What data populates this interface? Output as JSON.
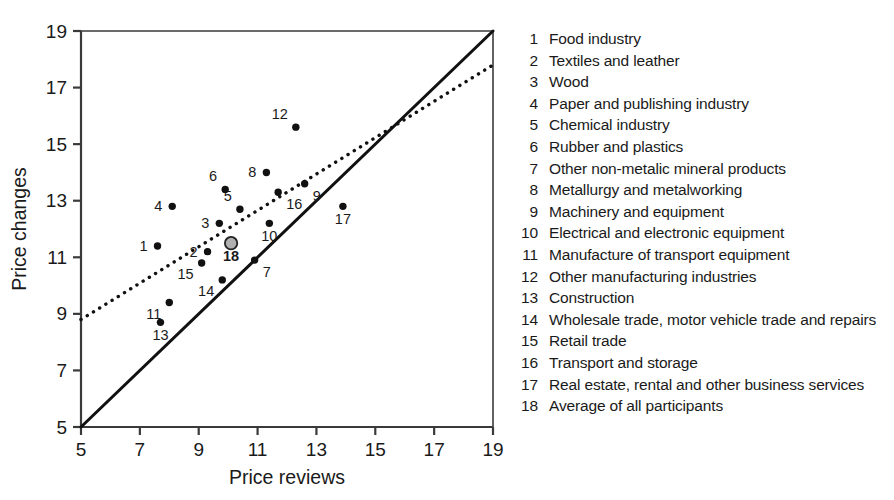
{
  "chart_data": {
    "type": "scatter",
    "title": "",
    "xlabel": "Price reviews",
    "ylabel": "Price changes",
    "xlim": [
      5,
      19
    ],
    "ylim": [
      5,
      19
    ],
    "xticks": [
      5,
      7,
      9,
      11,
      13,
      15,
      17,
      19
    ],
    "yticks": [
      5,
      7,
      9,
      11,
      13,
      15,
      17,
      19
    ],
    "grid": false,
    "legend_position": "right",
    "points": [
      {
        "id": 1,
        "x": 7.6,
        "y": 11.4,
        "label": "1",
        "label_pos": "left",
        "highlight": false
      },
      {
        "id": 2,
        "x": 9.3,
        "y": 11.2,
        "label": "2",
        "label_pos": "left",
        "highlight": false
      },
      {
        "id": 3,
        "x": 9.7,
        "y": 12.2,
        "label": "3",
        "label_pos": "left",
        "highlight": false
      },
      {
        "id": 4,
        "x": 8.1,
        "y": 12.8,
        "label": "4",
        "label_pos": "left",
        "highlight": false
      },
      {
        "id": 5,
        "x": 10.4,
        "y": 12.7,
        "label": "5",
        "label_pos": "above-left",
        "highlight": false
      },
      {
        "id": 6,
        "x": 9.9,
        "y": 13.4,
        "label": "6",
        "label_pos": "above-left",
        "highlight": false
      },
      {
        "id": 7,
        "x": 10.9,
        "y": 10.9,
        "label": "7",
        "label_pos": "below-right",
        "highlight": false
      },
      {
        "id": 8,
        "x": 11.3,
        "y": 14.0,
        "label": "8",
        "label_pos": "left",
        "highlight": false
      },
      {
        "id": 9,
        "x": 12.6,
        "y": 13.6,
        "label": "9",
        "label_pos": "below-right",
        "highlight": false
      },
      {
        "id": 10,
        "x": 11.4,
        "y": 12.2,
        "label": "10",
        "label_pos": "below",
        "highlight": false
      },
      {
        "id": 11,
        "x": 8.0,
        "y": 9.4,
        "label": "11",
        "label_pos": "below-left",
        "highlight": false
      },
      {
        "id": 12,
        "x": 12.3,
        "y": 15.6,
        "label": "12",
        "label_pos": "above-left",
        "highlight": false
      },
      {
        "id": 13,
        "x": 7.7,
        "y": 8.7,
        "label": "13",
        "label_pos": "below",
        "highlight": false
      },
      {
        "id": 14,
        "x": 9.8,
        "y": 10.2,
        "label": "14",
        "label_pos": "below-left",
        "highlight": false
      },
      {
        "id": 15,
        "x": 9.1,
        "y": 10.8,
        "label": "15",
        "label_pos": "below-left",
        "highlight": false
      },
      {
        "id": 16,
        "x": 11.7,
        "y": 13.3,
        "label": "16",
        "label_pos": "below-right",
        "highlight": false
      },
      {
        "id": 17,
        "x": 13.9,
        "y": 12.8,
        "label": "17",
        "label_pos": "below",
        "highlight": false
      },
      {
        "id": 18,
        "x": 10.1,
        "y": 11.5,
        "label": "18",
        "label_pos": "below",
        "highlight": true
      }
    ],
    "lines": [
      {
        "name": "identity-line",
        "style": "solid",
        "x1": 5,
        "y1": 5,
        "x2": 19,
        "y2": 19
      },
      {
        "name": "trend-line",
        "style": "dotted",
        "x1": 5,
        "y1": 8.8,
        "x2": 19,
        "y2": 17.8
      }
    ]
  },
  "legend": {
    "items": [
      {
        "num": "1",
        "label": "Food industry"
      },
      {
        "num": "2",
        "label": "Textiles and leather"
      },
      {
        "num": "3",
        "label": "Wood"
      },
      {
        "num": "4",
        "label": "Paper and publishing industry"
      },
      {
        "num": "5",
        "label": "Chemical industry"
      },
      {
        "num": "6",
        "label": "Rubber and plastics"
      },
      {
        "num": "7",
        "label": "Other non-metalic mineral products"
      },
      {
        "num": "8",
        "label": "Metallurgy and metalworking"
      },
      {
        "num": "9",
        "label": "Machinery and equipment"
      },
      {
        "num": "10",
        "label": "Electrical and electronic equipment"
      },
      {
        "num": "11",
        "label": "Manufacture of transport equipment"
      },
      {
        "num": "12",
        "label": "Other manufacturing industries"
      },
      {
        "num": "13",
        "label": "Construction"
      },
      {
        "num": "14",
        "label": "Wholesale trade, motor vehicle trade and repairs"
      },
      {
        "num": "15",
        "label": "Retail trade"
      },
      {
        "num": "16",
        "label": "Transport and storage"
      },
      {
        "num": "17",
        "label": "Real estate, rental and other business services"
      },
      {
        "num": "18",
        "label": "Average of all participants"
      }
    ]
  },
  "colors": {
    "axis": "#3a3a3a",
    "marker": "#111111",
    "marker_highlight_fill": "#b0b0b0",
    "marker_highlight_stroke": "#222222",
    "text": "#1a1a1a",
    "background": "#ffffff"
  }
}
